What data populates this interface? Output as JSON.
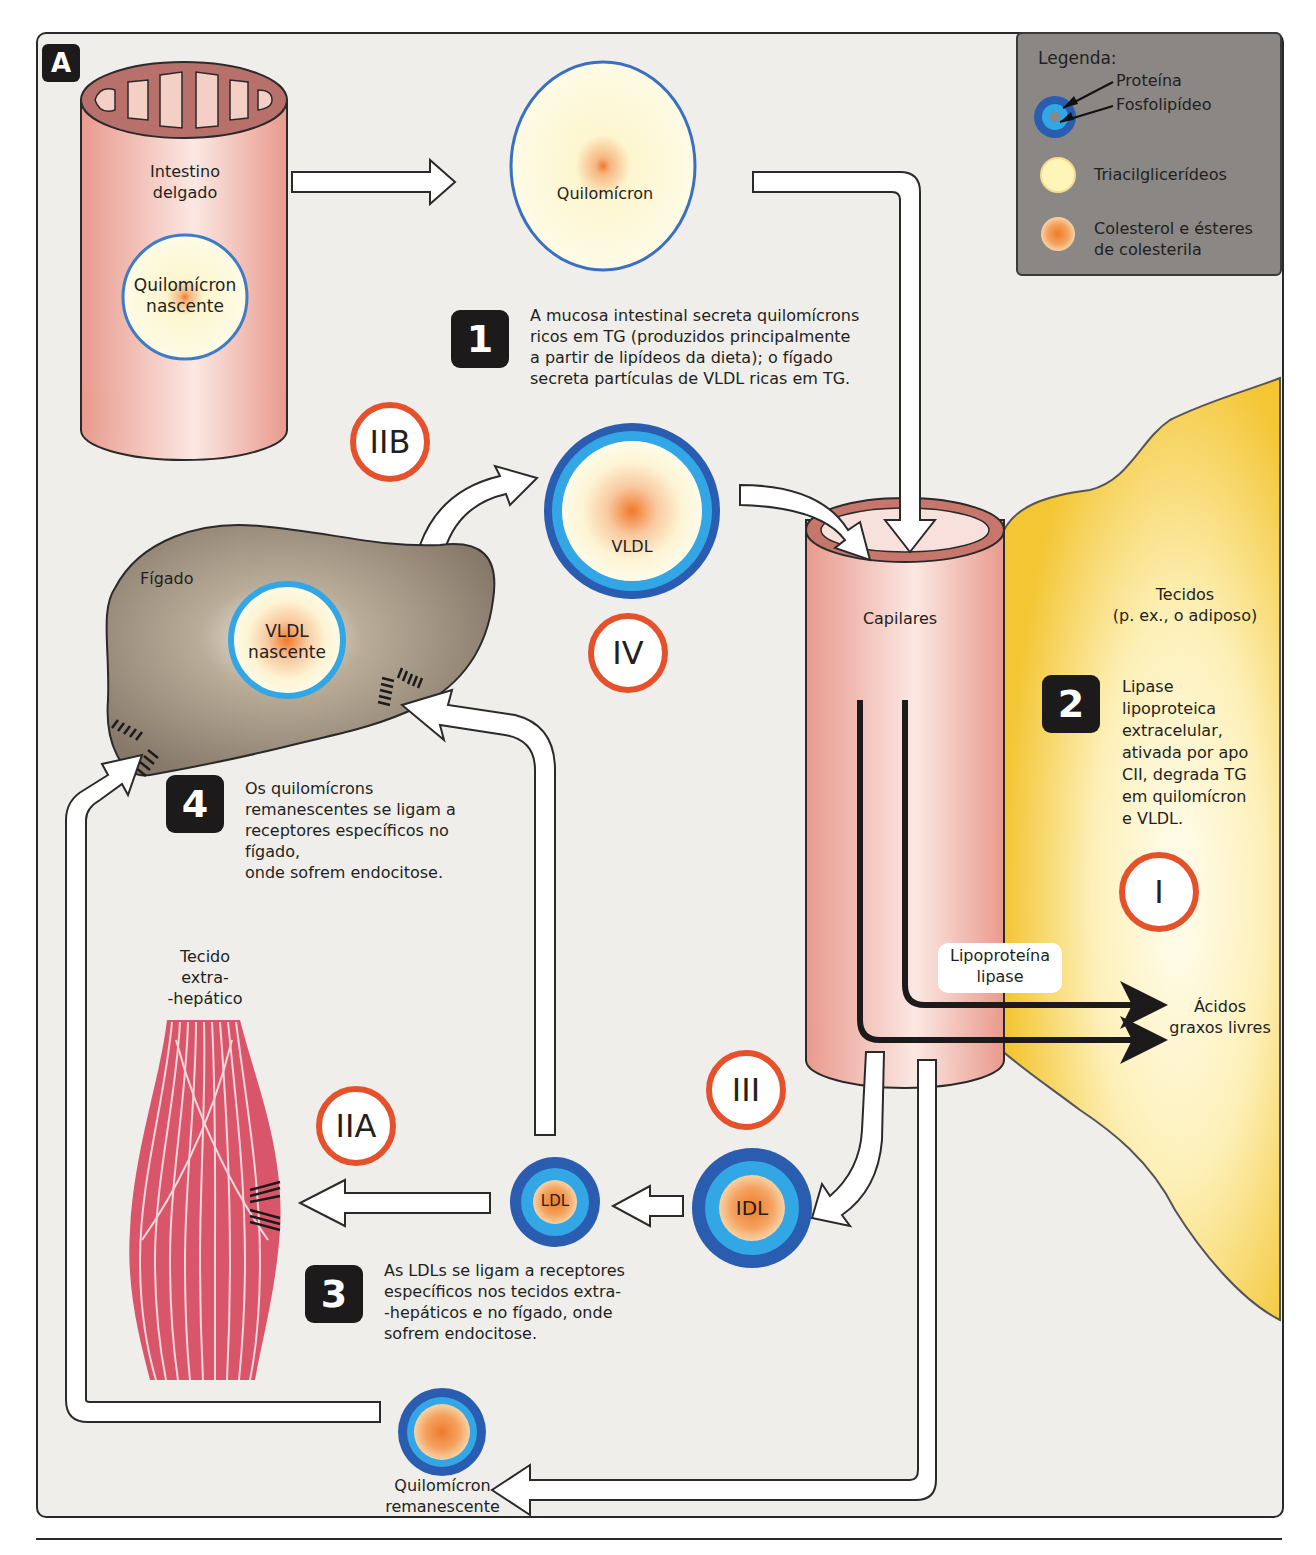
{
  "figure": {
    "panel_label": "A",
    "colors": {
      "protein_ring": "#2a5cb0",
      "phospholipid_ring": "#33a6e6",
      "triacylglycerol": "#fdf6cf",
      "cholesterol": "#f08a3c",
      "roman_ring": "#e4512b",
      "capillary": "#eca59a",
      "liver": "#8c7e6a",
      "adipose": "#f4c634",
      "muscle": "#d9566a",
      "step_box": "#1c1a1b"
    }
  },
  "legend": {
    "title": "Legenda:",
    "items": [
      {
        "label": "Proteína",
        "icon": "protein-ring-icon"
      },
      {
        "label": "Fosfolipídeo",
        "icon": "phospholipid-ring-icon"
      },
      {
        "label": "Triacilglicerídeos",
        "icon": "triacylglycerol-circle-icon"
      },
      {
        "label_line1": "Colesterol e ésteres",
        "label_line2": "de colesterila",
        "icon": "cholesterol-circle-icon"
      }
    ]
  },
  "structures": {
    "intestine": {
      "line1": "Intestino",
      "line2": "delgado"
    },
    "nascent_chylomicron": {
      "line1": "Quilomícron",
      "line2": "nascente"
    },
    "chylomicron": {
      "label": "Quilomícron"
    },
    "liver": {
      "label": "Fígado"
    },
    "nascent_vldl": {
      "line1": "VLDL",
      "line2": "nascente"
    },
    "vldl": {
      "label": "VLDL"
    },
    "capillaries": {
      "label": "Capilares"
    },
    "tissues": {
      "line1": "Tecidos",
      "line2": "(p. ex., o adiposo)"
    },
    "lipoprotein_lipase": {
      "line1": "Lipoproteína",
      "line2": "lipase"
    },
    "free_fatty_acids": {
      "line1": "Ácidos",
      "line2": "graxos livres"
    },
    "extrahepatic_tissue": {
      "line1": "Tecido",
      "line2": "extra-",
      "line3": "-hepático"
    },
    "ldl": {
      "label": "LDL"
    },
    "idl": {
      "label": "IDL"
    },
    "chylomicron_remnant": {
      "line1": "Quilomícron",
      "line2": "remanescente"
    }
  },
  "steps": [
    {
      "number": "1",
      "lines": [
        "A mucosa intestinal secreta quilomícrons",
        "ricos em TG (produzidos principalmente",
        "a partir de lipídeos da dieta); o fígado",
        "secreta partículas de VLDL ricas em TG."
      ]
    },
    {
      "number": "2",
      "lines": [
        "Lipase",
        "lipoproteica",
        "extracelular,",
        "ativada por apo",
        "CII, degrada TG",
        "em quilomícron",
        "e VLDL."
      ]
    },
    {
      "number": "3",
      "lines": [
        "As LDLs se ligam a receptores",
        "específicos nos tecidos extra-",
        "-hepáticos e no fígado, onde",
        "sofrem endocitose."
      ]
    },
    {
      "number": "4",
      "lines": [
        "Os quilomícrons",
        "remanescentes se ligam a",
        "receptores específicos no fígado,",
        "onde sofrem endocitose."
      ]
    }
  ],
  "hyperlipidemia_types": [
    {
      "label": "I"
    },
    {
      "label": "IIA"
    },
    {
      "label": "IIB"
    },
    {
      "label": "III"
    },
    {
      "label": "IV"
    }
  ]
}
